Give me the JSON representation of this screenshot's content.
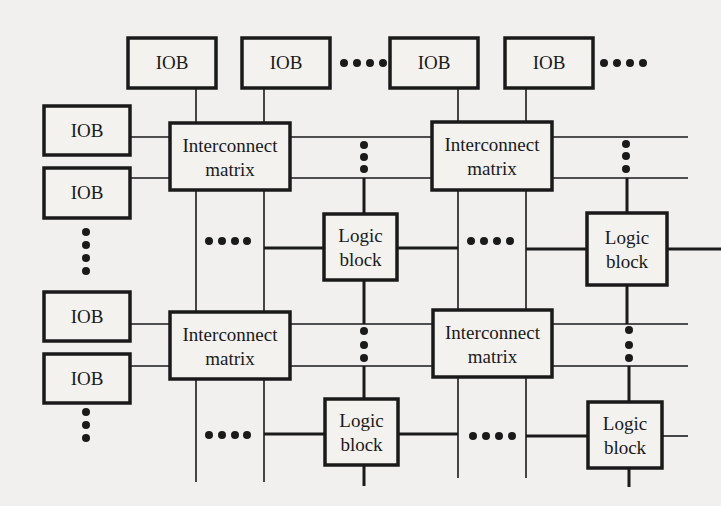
{
  "diagram": {
    "colors": {
      "background": "#f1f0ee",
      "ink": "#1a1a1a"
    },
    "top_iobs": [
      {
        "label": "IOB",
        "x": 128,
        "y": 38,
        "w": 88,
        "h": 50
      },
      {
        "label": "IOB",
        "x": 242,
        "y": 38,
        "w": 88,
        "h": 50
      },
      {
        "label": "IOB",
        "x": 390,
        "y": 38,
        "w": 88,
        "h": 50
      },
      {
        "label": "IOB",
        "x": 505,
        "y": 38,
        "w": 88,
        "h": 50
      }
    ],
    "left_iobs": [
      {
        "label": "IOB",
        "x": 44,
        "y": 106,
        "w": 86,
        "h": 49
      },
      {
        "label": "IOB",
        "x": 44,
        "y": 168,
        "w": 86,
        "h": 50
      },
      {
        "label": "IOB",
        "x": 44,
        "y": 292,
        "w": 86,
        "h": 49
      },
      {
        "label": "IOB",
        "x": 44,
        "y": 354,
        "w": 86,
        "h": 49
      }
    ],
    "interconnect_matrices": [
      {
        "line1": "Interconnect",
        "line2": "matrix",
        "x": 170,
        "y": 123,
        "w": 120,
        "h": 67
      },
      {
        "line1": "Interconnect",
        "line2": "matrix",
        "x": 432,
        "y": 122,
        "w": 120,
        "h": 68
      },
      {
        "line1": "Interconnect",
        "line2": "matrix",
        "x": 170,
        "y": 312,
        "w": 120,
        "h": 67
      },
      {
        "line1": "Interconnect",
        "line2": "matrix",
        "x": 433,
        "y": 310,
        "w": 119,
        "h": 67
      }
    ],
    "logic_blocks": [
      {
        "line1": "Logic",
        "line2": "block",
        "x": 324,
        "y": 214,
        "w": 73,
        "h": 66
      },
      {
        "line1": "Logic",
        "line2": "block",
        "x": 587,
        "y": 213,
        "w": 80,
        "h": 72
      },
      {
        "line1": "Logic",
        "line2": "block",
        "x": 325,
        "y": 399,
        "w": 73,
        "h": 66
      },
      {
        "line1": "Logic",
        "line2": "block",
        "x": 588,
        "y": 402,
        "w": 74,
        "h": 66
      }
    ],
    "ellipsis_symbol": "••••"
  }
}
